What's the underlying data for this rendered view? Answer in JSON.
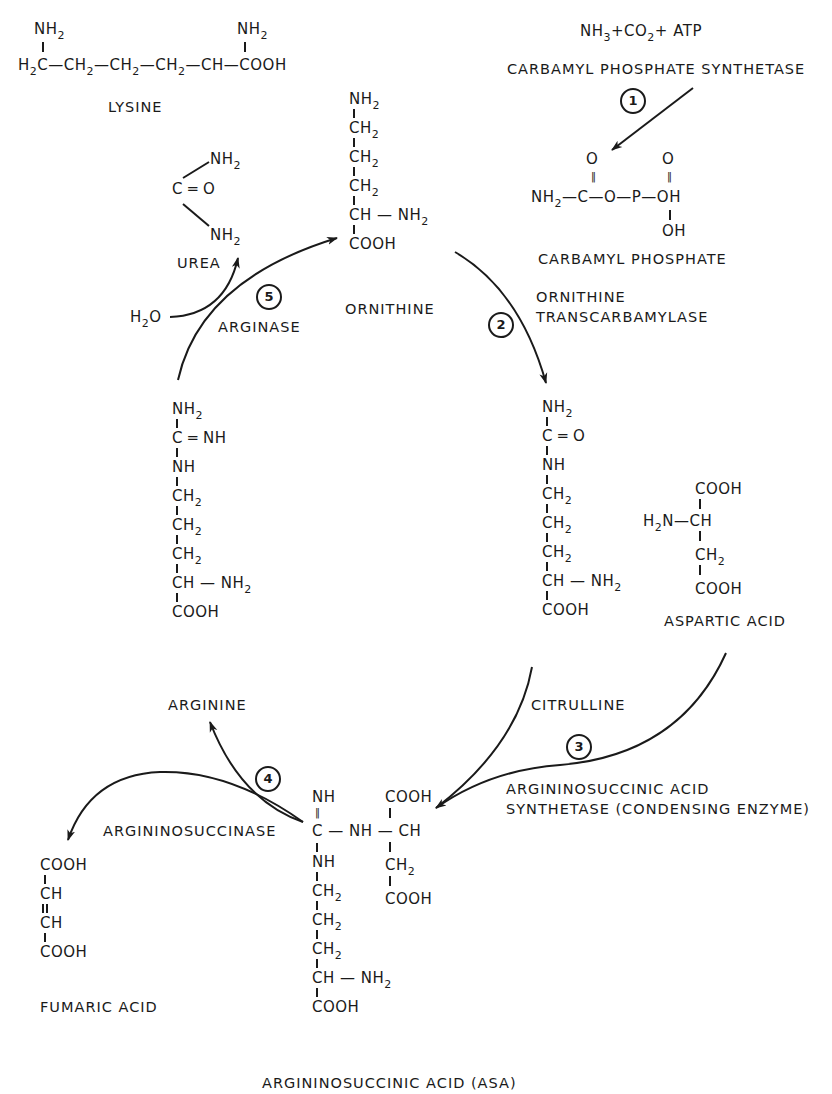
{
  "diagram": {
    "type": "metabolic-pathway",
    "accent_color": "#1a1a1a",
    "background_color": "#ffffff"
  },
  "lysine": {
    "formula_top_left": "NH2",
    "formula_top_right": "NH2",
    "chain": "H2C — CH2 — CH2 — CH2 — CH — COOH",
    "label": "LYSINE"
  },
  "step1": {
    "reactants": "NH3 + CO2 + ATP",
    "enzyme": "CARBAMYL PHOSPHATE SYNTHETASE",
    "number": "1"
  },
  "carbamyl_phosphate": {
    "o1": "O",
    "o2": "O",
    "chain": "NH2 — C — O — P — OH",
    "oh": "OH",
    "label": "CARBAMYL PHOSPHATE"
  },
  "ornithine": {
    "rows": [
      "NH2",
      "CH2",
      "CH2",
      "CH2",
      "CH — NH2",
      "COOH"
    ],
    "label": "ORNITHINE"
  },
  "urea": {
    "nh2_top": "NH2",
    "co": "C = O",
    "nh2_bottom": "NH2",
    "label": "UREA"
  },
  "step5": {
    "number": "5",
    "enzyme": "ARGINASE",
    "reactant": "H2O"
  },
  "step2": {
    "number": "2",
    "enzyme_line1": "ORNITHINE",
    "enzyme_line2": "TRANSCARBAMYLASE"
  },
  "citrulline": {
    "rows": [
      "NH2",
      "C = O",
      "NH",
      "CH2",
      "CH2",
      "CH2",
      "CH — NH2",
      "COOH"
    ],
    "label": "CITRULLINE"
  },
  "aspartic_acid": {
    "rows": [
      "COOH",
      "H2N — CH",
      "CH2",
      "COOH"
    ],
    "label": "ASPARTIC ACID"
  },
  "arginine": {
    "rows": [
      "NH2",
      "C = NH",
      "NH",
      "CH2",
      "CH2",
      "CH2",
      "CH — NH2",
      "COOH"
    ],
    "label": "ARGININE"
  },
  "step3": {
    "number": "3",
    "enzyme_line1": "ARGININOSUCCINIC ACID",
    "enzyme_line2": "SYNTHETASE (CONDENSING ENZYME)"
  },
  "step4": {
    "number": "4",
    "enzyme": "ARGININOSUCCINASE"
  },
  "fumaric_acid": {
    "rows": [
      "COOH",
      "CH",
      "CH",
      "COOH"
    ],
    "label": "FUMARIC ACID"
  },
  "asa": {
    "left_rows": [
      "NH",
      "C — NH — CH",
      "NH",
      "CH2",
      "CH2",
      "CH2",
      "CH — NH2",
      "COOH"
    ],
    "right_rows": [
      "COOH",
      "CH2",
      "COOH"
    ],
    "label": "ARGININOSUCCINIC ACID (ASA)"
  }
}
